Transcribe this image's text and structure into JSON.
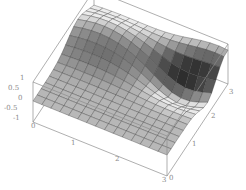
{
  "chart_data": {
    "type": "surface3d",
    "title": "",
    "xlabel": "",
    "ylabel": "",
    "zlabel": "",
    "x_ticks": [
      "1",
      "2",
      "3"
    ],
    "y_ticks": [
      "0",
      "1",
      "2",
      "3"
    ],
    "z_ticks": [
      "1",
      "0.5",
      "0",
      "-0.5",
      "-1"
    ],
    "x_origin_label": "0",
    "y_origin_label": "0",
    "x_range": [
      0,
      3
    ],
    "y_range": [
      0,
      3
    ],
    "z_range": [
      -1,
      1
    ],
    "grid_resolution": 15,
    "surface": "smooth ridge rising to a peak near the back-left (z≈1), dipping toward the back-right (z≈-1), rising again at right edge; mostly flat near z≈0 in front",
    "shading": "grayscale lit surface with mesh lines",
    "box": true
  },
  "axes": {
    "z_labels": [
      {
        "text": "1",
        "x": 20,
        "y": 80
      },
      {
        "text": "0.5",
        "x": 8,
        "y": 90
      },
      {
        "text": "0",
        "x": 18,
        "y": 100
      },
      {
        "text": "-0.5",
        "x": 4,
        "y": 110
      },
      {
        "text": "-1",
        "x": 13,
        "y": 120
      }
    ],
    "x_labels": [
      {
        "text": "0",
        "x": 31,
        "y": 128
      },
      {
        "text": "1",
        "x": 71,
        "y": 145
      },
      {
        "text": "2",
        "x": 115,
        "y": 161
      },
      {
        "text": "3",
        "x": 162,
        "y": 182
      }
    ],
    "y_labels": [
      {
        "text": "0",
        "x": 169,
        "y": 180
      },
      {
        "text": "1",
        "x": 192,
        "y": 146
      },
      {
        "text": "2",
        "x": 211,
        "y": 118
      },
      {
        "text": "3",
        "x": 229,
        "y": 94
      }
    ]
  }
}
